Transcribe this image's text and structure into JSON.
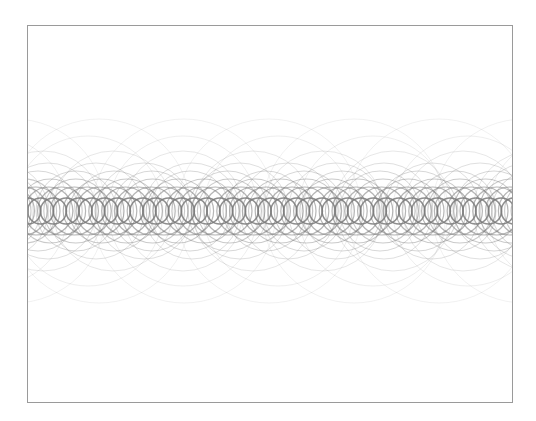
{
  "canvas": {
    "frame": {
      "x": 27,
      "y": 25,
      "width": 485,
      "height": 377,
      "border_color": "#9a9a9a",
      "background": "#ffffff"
    },
    "pattern": {
      "description": "Overlapping circle outlines along a horizontal band",
      "center_y": 185,
      "stroke_color": "#7a7a7a",
      "layers": [
        {
          "radius": 13,
          "spacing": 12.8,
          "offset": 0,
          "opacity": 0.85,
          "stroke_width": 1.6
        },
        {
          "radius": 24,
          "spacing": 12.8,
          "offset": 6.4,
          "opacity": 0.55,
          "stroke_width": 1.2
        },
        {
          "radius": 32,
          "spacing": 25.6,
          "offset": 3,
          "opacity": 0.4,
          "stroke_width": 1.1
        },
        {
          "radius": 40,
          "spacing": 38,
          "offset": 12,
          "opacity": 0.3,
          "stroke_width": 1
        },
        {
          "radius": 48,
          "spacing": 48,
          "offset": 20,
          "opacity": 0.24,
          "stroke_width": 1
        },
        {
          "radius": 60,
          "spacing": 70,
          "offset": 5,
          "opacity": 0.18,
          "stroke_width": 1
        },
        {
          "radius": 75,
          "spacing": 95,
          "offset": 40,
          "opacity": 0.13,
          "stroke_width": 1
        },
        {
          "radius": 92,
          "spacing": 85,
          "offset": 78,
          "opacity": 0.1,
          "stroke_width": 1
        }
      ]
    }
  }
}
